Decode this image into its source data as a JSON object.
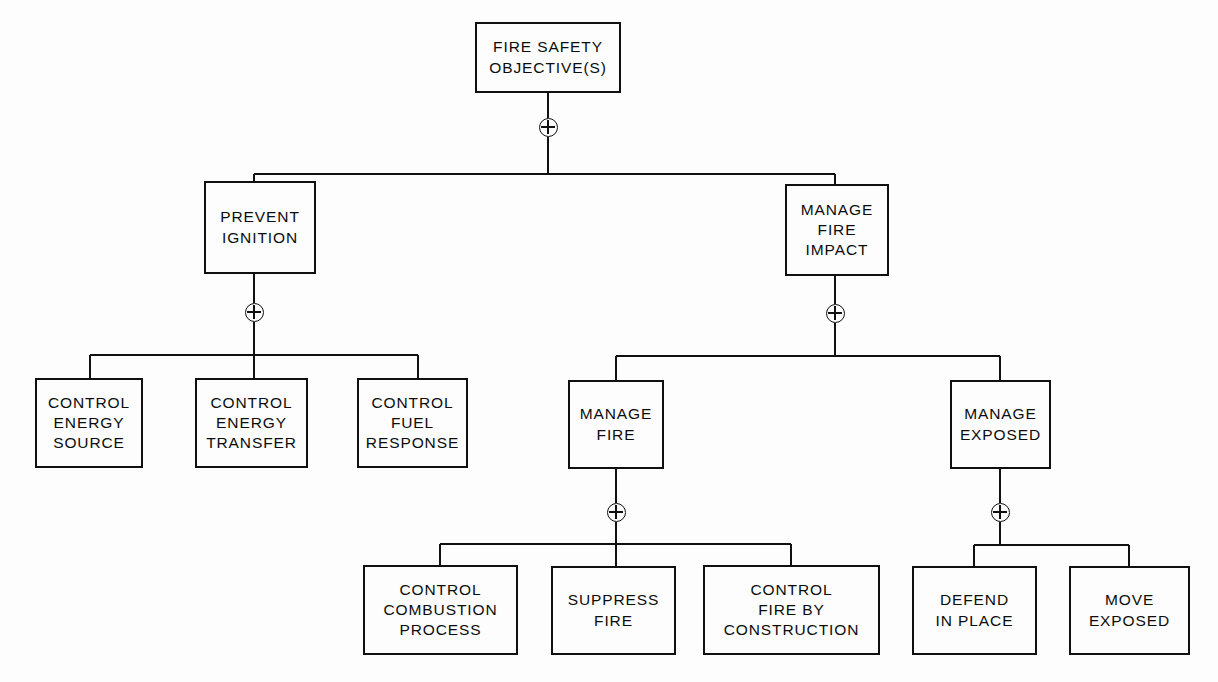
{
  "diagram": {
    "type": "fault-tree",
    "background_color": "#fdfdfd",
    "line_color": "#101010",
    "gate_symbol": "circled-plus",
    "gate_meaning": "OR",
    "nodes": [
      {
        "id": "root",
        "label": "FIRE SAFETY\nOBJECTIVE(S)",
        "level": 1,
        "x": 475,
        "y": 22,
        "w": 146,
        "h": 71,
        "center_x": 548
      },
      {
        "id": "prevent-ignition",
        "label": "PREVENT\nIGNITION",
        "level": 2,
        "x": 204,
        "y": 181,
        "w": 112,
        "h": 93,
        "center_x": 254
      },
      {
        "id": "manage-fire-impact",
        "label": "MANAGE\nFIRE\nIMPACT",
        "level": 2,
        "x": 785,
        "y": 184,
        "w": 104,
        "h": 92,
        "center_x": 835
      },
      {
        "id": "control-energy-source",
        "label": "CONTROL\nENERGY\nSOURCE",
        "level": 3,
        "x": 35,
        "y": 378,
        "w": 108,
        "h": 90,
        "center_x": 90
      },
      {
        "id": "control-energy-transfer",
        "label": "CONTROL\nENERGY\nTRANSFER",
        "level": 3,
        "x": 195,
        "y": 378,
        "w": 113,
        "h": 90,
        "center_x": 254
      },
      {
        "id": "control-fuel-response",
        "label": "CONTROL\nFUEL\nRESPONSE",
        "level": 3,
        "x": 357,
        "y": 378,
        "w": 111,
        "h": 90,
        "center_x": 418
      },
      {
        "id": "manage-fire",
        "label": "MANAGE\nFIRE",
        "level": 3,
        "x": 568,
        "y": 380,
        "w": 96,
        "h": 89,
        "center_x": 616
      },
      {
        "id": "manage-exposed",
        "label": "MANAGE\nEXPOSED",
        "level": 3,
        "x": 950,
        "y": 380,
        "w": 101,
        "h": 89,
        "center_x": 1000
      },
      {
        "id": "control-combustion-process",
        "label": "CONTROL\nCOMBUSTION\nPROCESS",
        "level": 4,
        "x": 363,
        "y": 565,
        "w": 155,
        "h": 90,
        "center_x": 440
      },
      {
        "id": "suppress-fire",
        "label": "SUPPRESS\nFIRE",
        "level": 4,
        "x": 551,
        "y": 566,
        "w": 125,
        "h": 89,
        "center_x": 616
      },
      {
        "id": "control-fire-by-construction",
        "label": "CONTROL\nFIRE BY\nCONSTRUCTION",
        "level": 4,
        "x": 703,
        "y": 565,
        "w": 177,
        "h": 90,
        "center_x": 791
      },
      {
        "id": "defend-in-place",
        "label": "DEFEND\nIN PLACE",
        "level": 4,
        "x": 912,
        "y": 566,
        "w": 125,
        "h": 89,
        "center_x": 974
      },
      {
        "id": "move-exposed",
        "label": "MOVE\nEXPOSED",
        "level": 4,
        "x": 1069,
        "y": 566,
        "w": 121,
        "h": 89,
        "center_x": 1129
      }
    ],
    "gates": [
      {
        "id": "gate-root",
        "parent": "root",
        "x": 548,
        "y": 127
      },
      {
        "id": "gate-prevent-ignition",
        "parent": "prevent-ignition",
        "x": 254,
        "y": 312
      },
      {
        "id": "gate-manage-fire-impact",
        "parent": "manage-fire-impact",
        "x": 835,
        "y": 313
      },
      {
        "id": "gate-manage-fire",
        "parent": "manage-fire",
        "x": 616,
        "y": 512
      },
      {
        "id": "gate-manage-exposed",
        "parent": "manage-exposed",
        "x": 1000,
        "y": 512
      }
    ],
    "links": [
      {
        "from": "root",
        "gate": "gate-root",
        "bus_y": 174,
        "children_x": [
          254,
          835
        ]
      },
      {
        "from": "prevent-ignition",
        "gate": "gate-prevent-ignition",
        "bus_y": 355,
        "children_x": [
          90,
          254,
          418
        ]
      },
      {
        "from": "manage-fire-impact",
        "gate": "gate-manage-fire-impact",
        "bus_y": 356,
        "children_x": [
          616,
          1000
        ]
      },
      {
        "from": "manage-fire",
        "gate": "gate-manage-fire",
        "bus_y": 544,
        "children_x": [
          440,
          616,
          791
        ]
      },
      {
        "from": "manage-exposed",
        "gate": "gate-manage-exposed",
        "bus_y": 545,
        "children_x": [
          974,
          1129
        ]
      }
    ]
  }
}
